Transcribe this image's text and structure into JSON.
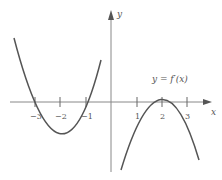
{
  "graph": {
    "x_axis_label": "x",
    "y_axis_label": "y",
    "curve_label": "y = f′(x)",
    "x_ticks": [
      "−3",
      "−2",
      "−1",
      "1",
      "2",
      "3"
    ],
    "curve_color": "#555555",
    "axis_color": "#777777"
  }
}
